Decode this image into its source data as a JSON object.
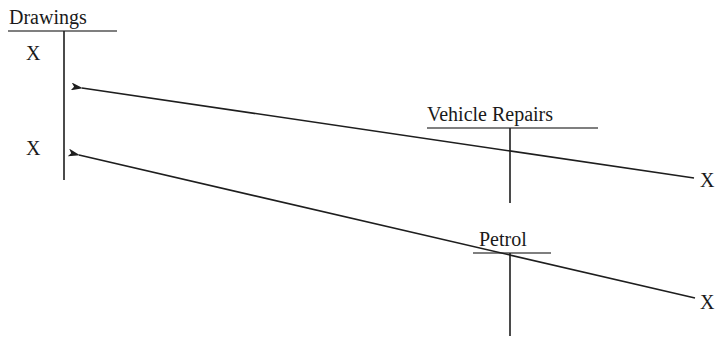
{
  "diagram": {
    "type": "T-account double-entry diagram",
    "accounts": [
      {
        "id": "drawings",
        "title": "Drawings",
        "entries_debit": [
          "X",
          "X"
        ]
      },
      {
        "id": "vehicle_repairs",
        "title": "Vehicle Repairs",
        "entries_credit": [
          "X"
        ]
      },
      {
        "id": "petrol",
        "title": "Petrol",
        "entries_credit": [
          "X"
        ]
      }
    ],
    "arrows": [
      {
        "from": "vehicle_repairs",
        "to": "drawings",
        "label": ""
      },
      {
        "from": "petrol",
        "to": "drawings",
        "label": ""
      }
    ],
    "labels": {
      "drawings_title": "Drawings",
      "drawings_entry_1": "X",
      "drawings_entry_2": "X",
      "vehicle_repairs_title": "Vehicle Repairs",
      "vehicle_repairs_entry": "X",
      "petrol_title": "Petrol",
      "petrol_entry": "X"
    },
    "colors": {
      "ink": "#1e1e1e",
      "background": "#ffffff"
    }
  }
}
